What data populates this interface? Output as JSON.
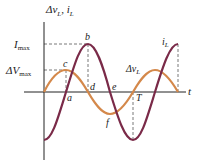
{
  "diagram": {
    "y_axis_label": {
      "main": "Δv",
      "sub1": "L",
      "sep": ", ",
      "main2": "i",
      "sub2": "L"
    },
    "x_axis_label": "t",
    "levels": {
      "i_max": {
        "main": "I",
        "sub": "max"
      },
      "v_max": {
        "main": "ΔV",
        "sub": "max"
      }
    },
    "points": {
      "a": "a",
      "b": "b",
      "c": "c",
      "d": "d",
      "e": "e",
      "f": "f",
      "T": "T"
    },
    "curve_labels": {
      "current": {
        "main": "i",
        "sub": "L"
      },
      "voltage": {
        "main": "Δv",
        "sub": "L"
      }
    },
    "colors": {
      "current": "#7a2a48",
      "voltage": "#d4884a",
      "axis": "#222222",
      "dashed": "#555555"
    }
  }
}
